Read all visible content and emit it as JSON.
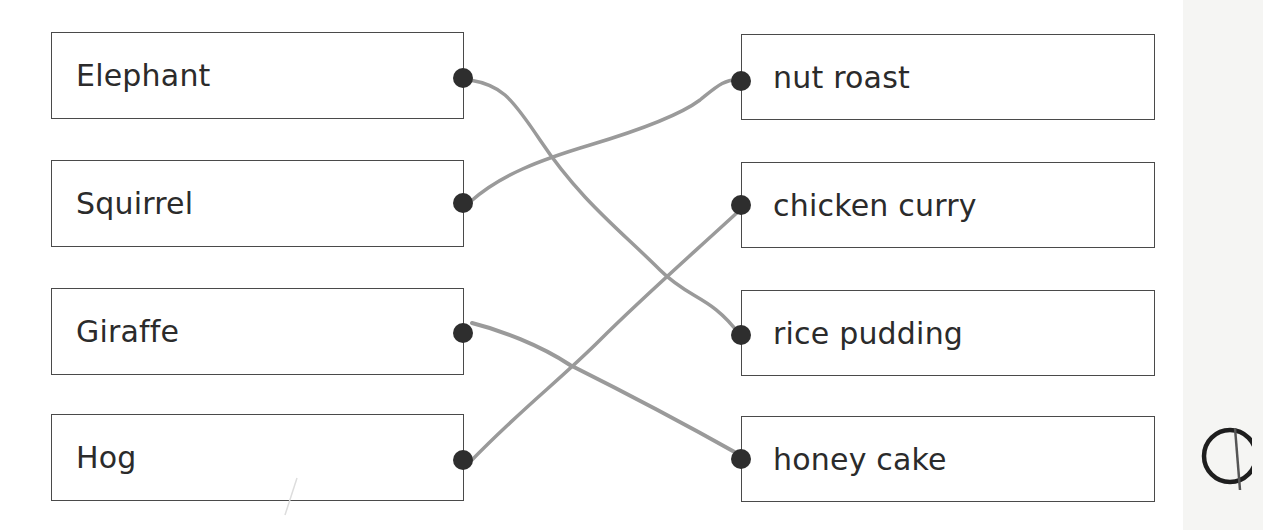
{
  "worksheet": {
    "left_items": [
      {
        "label": "Elephant"
      },
      {
        "label": "Squirrel"
      },
      {
        "label": "Giraffe"
      },
      {
        "label": "Hog"
      }
    ],
    "right_items": [
      {
        "label": "nut roast"
      },
      {
        "label": "chicken curry"
      },
      {
        "label": "rice pudding"
      },
      {
        "label": "honey cake"
      }
    ],
    "matches": [
      {
        "from": "Elephant",
        "to": "rice pudding"
      },
      {
        "from": "Squirrel",
        "to": "nut roast"
      },
      {
        "from": "Giraffe",
        "to": "honey cake"
      },
      {
        "from": "Hog",
        "to": "chicken curry"
      }
    ],
    "line_color": "#9a9a9a",
    "dot_color": "#2e2e2e",
    "mark_symbol": "circle-with-stroke"
  }
}
